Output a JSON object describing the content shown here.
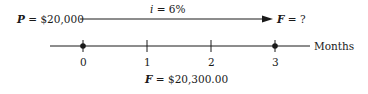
{
  "diagram": {
    "present_label": "P",
    "present_value": "= $20,000",
    "rate_symbol": "i",
    "rate_value": "= 6%",
    "future_label": "F",
    "future_value": "= ?",
    "axis_label": "Months",
    "ticks": [
      "0",
      "1",
      "2",
      "3"
    ],
    "result_label": "F",
    "result_value": "= $20,300.00",
    "colors": {
      "ink": "#1a1a1a",
      "background": "#ffffff"
    }
  }
}
